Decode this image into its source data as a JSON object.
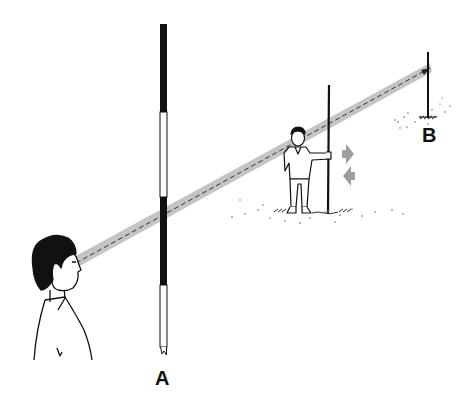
{
  "figure": {
    "labels": {
      "pole_a": "A",
      "pole_b": "B"
    },
    "icons": {
      "move_right_arrow": "arrow-right",
      "move_left_arrow": "arrow-left"
    },
    "colors": {
      "ink": "#111111",
      "sight_line": "#bdbdbd",
      "arrow": "#9e9e9e",
      "background": "#ffffff"
    }
  }
}
